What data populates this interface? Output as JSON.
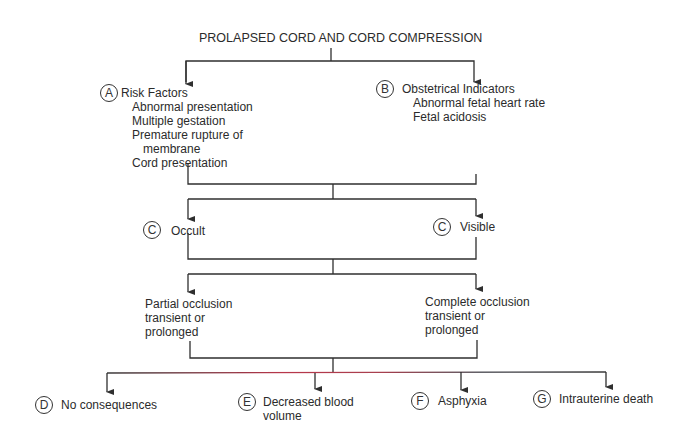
{
  "title": "PROLAPSED CORD AND CORD COMPRESSION",
  "nodes": {
    "risk_factors": {
      "badge": "A",
      "heading": "Risk Factors",
      "items": [
        "Abnormal presentation",
        "Multiple gestation",
        "Premature rupture of",
        "membrane",
        "Cord presentation"
      ]
    },
    "obstetrical_indicators": {
      "badge": "B",
      "heading": "Obstetrical Indicators",
      "items": [
        "Abnormal fetal heart rate",
        "Fetal acidosis"
      ]
    },
    "occult": {
      "badge": "C",
      "label": "Occult"
    },
    "visible": {
      "badge": "C",
      "label": "Visible"
    },
    "partial_occlusion": {
      "lines": [
        "Partial occlusion",
        "transient or",
        "prolonged"
      ]
    },
    "complete_occlusion": {
      "lines": [
        "Complete occlusion",
        "transient or",
        "prolonged"
      ]
    },
    "no_consequences": {
      "badge": "D",
      "label": "No consequences"
    },
    "decreased_blood_volume": {
      "badge": "E",
      "lines": [
        "Decreased blood",
        "volume"
      ]
    },
    "asphyxia": {
      "badge": "F",
      "label": "Asphyxia"
    },
    "intrauterine_death": {
      "badge": "G",
      "label": "Intrauterine death"
    }
  },
  "colors": {
    "line": "#2f2f2f",
    "bottom_line_tint": "#c0394b",
    "background": "#ffffff"
  }
}
